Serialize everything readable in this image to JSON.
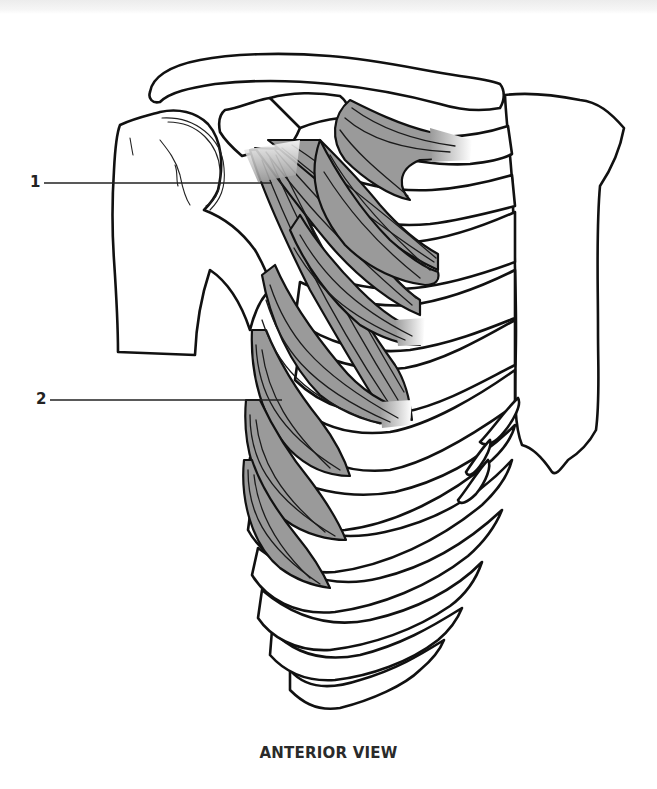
{
  "figure": {
    "view_caption": "ANTERIOR VIEW",
    "labels": [
      {
        "number": "1",
        "structure": "pectoralis-minor"
      },
      {
        "number": "2",
        "structure": "serratus-anterior"
      }
    ],
    "colors": {
      "background": "#ffffff",
      "bone_fill": "#ffffff",
      "outline": "#111111",
      "muscle_fill": "#9a9a9a"
    }
  }
}
